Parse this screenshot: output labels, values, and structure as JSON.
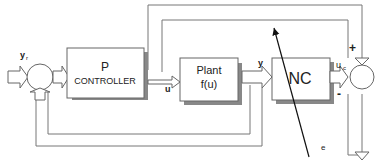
{
  "diagram": {
    "blocks": {
      "p_controller": {
        "title": "P",
        "subtitle": "CONTROLLER"
      },
      "plant": {
        "title": "Plant",
        "subtitle": "f(u)"
      },
      "nc": {
        "title": "NC"
      }
    },
    "signals": {
      "yr": "y",
      "yr_sub": "r",
      "u": "u",
      "y": "y",
      "uc": "u",
      "uc_sub": "c",
      "e": "e"
    },
    "signs": {
      "plus": "+",
      "minus": "-"
    }
  }
}
